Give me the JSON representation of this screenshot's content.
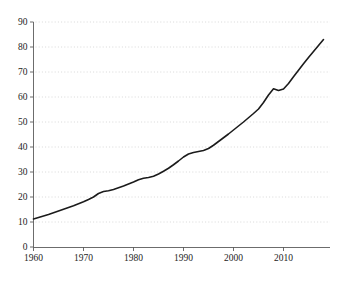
{
  "chart_data": {
    "type": "line",
    "title": "",
    "subtitle": "",
    "xlabel": "",
    "ylabel": "",
    "xlim": [
      1960,
      2018
    ],
    "ylim": [
      0,
      90
    ],
    "grid": "horizontal-dotted",
    "legend": "none",
    "x_ticks": [
      "1960",
      "1970",
      "1980",
      "1990",
      "2000",
      "2010"
    ],
    "x_tick_values": [
      1960,
      1970,
      1980,
      1990,
      2000,
      2010
    ],
    "y_ticks": [
      "0",
      "10",
      "20",
      "30",
      "40",
      "50",
      "60",
      "70",
      "80",
      "90"
    ],
    "y_tick_values": [
      0,
      10,
      20,
      30,
      40,
      50,
      60,
      70,
      80,
      90
    ],
    "series": [
      {
        "name": "series-1",
        "color": "#1b1b1b",
        "x": [
          1960,
          1961,
          1962,
          1963,
          1964,
          1965,
          1966,
          1967,
          1968,
          1969,
          1970,
          1971,
          1972,
          1973,
          1974,
          1975,
          1976,
          1977,
          1978,
          1979,
          1980,
          1981,
          1982,
          1983,
          1984,
          1985,
          1986,
          1987,
          1988,
          1989,
          1990,
          1991,
          1992,
          1993,
          1994,
          1995,
          1996,
          1997,
          1998,
          1999,
          2000,
          2001,
          2002,
          2003,
          2004,
          2005,
          2006,
          2007,
          2008,
          2009,
          2010,
          2011,
          2012,
          2013,
          2014,
          2015,
          2016,
          2017,
          2018
        ],
        "values": [
          11.2,
          11.8,
          12.4,
          13.0,
          13.7,
          14.4,
          15.1,
          15.8,
          16.5,
          17.3,
          18.1,
          19.0,
          20.0,
          21.4,
          22.2,
          22.5,
          23.0,
          23.7,
          24.4,
          25.2,
          26.0,
          26.9,
          27.5,
          27.8,
          28.3,
          29.2,
          30.3,
          31.5,
          32.9,
          34.4,
          36.0,
          37.2,
          37.8,
          38.2,
          38.6,
          39.4,
          40.7,
          42.2,
          43.7,
          45.2,
          46.8,
          48.4,
          50.0,
          51.7,
          53.4,
          55.2,
          57.8,
          60.8,
          63.3,
          62.6,
          63.2,
          65.4,
          68.1,
          70.7,
          73.3,
          75.8,
          78.2,
          80.6,
          83.0
        ]
      }
    ]
  },
  "axes": {
    "y_axis_name": "y-axis",
    "x_axis_name": "x-axis"
  }
}
